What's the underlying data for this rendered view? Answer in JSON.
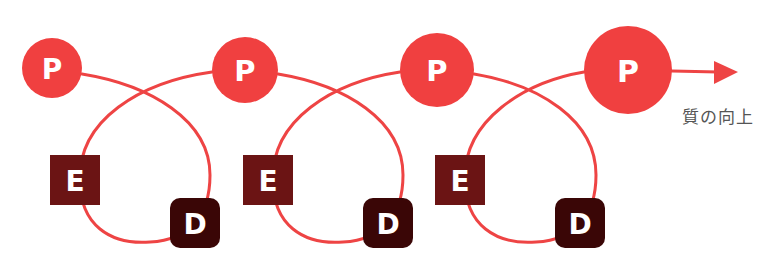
{
  "diagram": {
    "type": "PDCA-like spiral (PED cycle)",
    "colors": {
      "line": "#ee4444",
      "p_node": "#f04040",
      "e_node": "#6b1414",
      "d_node": "#3a0606",
      "label_text": "#ffffff",
      "caption_text": "#555555"
    },
    "p_nodes": [
      {
        "label": "P",
        "cx": 52,
        "cy": 68,
        "r": 30
      },
      {
        "label": "P",
        "cx": 245,
        "cy": 70,
        "r": 33
      },
      {
        "label": "P",
        "cx": 437,
        "cy": 70,
        "r": 37
      },
      {
        "label": "P",
        "cx": 628,
        "cy": 70,
        "r": 44
      }
    ],
    "e_nodes": [
      {
        "label": "E",
        "x": 50,
        "y": 155,
        "size": 50
      },
      {
        "label": "E",
        "x": 243,
        "y": 155,
        "size": 50
      },
      {
        "label": "E",
        "x": 435,
        "y": 155,
        "size": 50
      }
    ],
    "d_nodes": [
      {
        "label": "D",
        "x": 170,
        "y": 198,
        "size": 50
      },
      {
        "label": "D",
        "x": 363,
        "y": 198,
        "size": 50
      },
      {
        "label": "D",
        "x": 555,
        "y": 198,
        "size": 50
      }
    ],
    "arrow_caption": "質の向上"
  }
}
